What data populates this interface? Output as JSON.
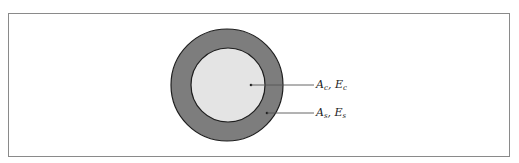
{
  "diagram": {
    "type": "cross-section",
    "colors": {
      "frame_border": "#8a8a8a",
      "outer_ring_fill": "#7d7d7d",
      "inner_core_fill": "#e4e4e4",
      "outline": "#1e1e1e",
      "leader_line": "#555555"
    },
    "labels": [
      {
        "id": "core",
        "area_symbol": "A",
        "area_sub": "c",
        "sep": ", ",
        "modulus_symbol": "E",
        "modulus_sub": "c",
        "text": "Ac, Ec"
      },
      {
        "id": "shell",
        "area_symbol": "A",
        "area_sub": "s",
        "sep": ", ",
        "modulus_symbol": "E",
        "modulus_sub": "s",
        "text": "As, Es"
      }
    ]
  }
}
